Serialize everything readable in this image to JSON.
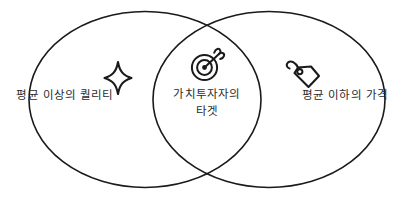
{
  "diagram": {
    "type": "venn",
    "sets": 2,
    "background_color": "#ffffff",
    "stroke_color": "#1a1a1a",
    "text_color": "#2b2b2b",
    "left_set": {
      "label": "평균 이상의 퀄리티",
      "icon": "sparkle-icon"
    },
    "right_set": {
      "label": "평균 이하의 가격",
      "icon": "price-tag-icon"
    },
    "intersection": {
      "label_line1": "가치투자자의",
      "label_line2": "타겟",
      "icon": "target-arrow-icon"
    }
  }
}
